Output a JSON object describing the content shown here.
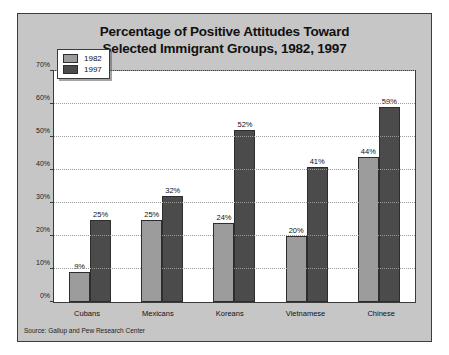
{
  "chart_data": {
    "type": "bar",
    "title": "Percentage of Positive Attitudes Toward Selected Immigrant Groups, 1982, 1997",
    "title_line1": "Percentage of Positive Attitudes Toward",
    "title_line2": "Selected Immigrant Groups, 1982, 1997",
    "xlabel": "",
    "ylabel": "",
    "ylim": [
      0,
      70
    ],
    "yticks": [
      0,
      10,
      20,
      30,
      40,
      50,
      60,
      70
    ],
    "ytick_labels": [
      "0%",
      "10%",
      "20%",
      "30%",
      "40%",
      "50%",
      "60%",
      "70%"
    ],
    "categories": [
      "Cubans",
      "Mexicans",
      "Koreans",
      "Vietnamese",
      "Chinese"
    ],
    "series": [
      {
        "name": "1982",
        "color": "#9c9c9c",
        "values": [
          9,
          25,
          24,
          20,
          44
        ],
        "labels": [
          "9%",
          "25%",
          "24%",
          "20%",
          "44%"
        ]
      },
      {
        "name": "1997",
        "color": "#4b4b4b",
        "values": [
          25,
          32,
          52,
          41,
          59
        ],
        "labels": [
          "25%",
          "32%",
          "52%",
          "41%",
          "59%"
        ]
      }
    ],
    "grid": true,
    "grid_style": "dotted-horizontal",
    "legend_position": "top-left",
    "source": "Source: Gallup and Pew Research Center"
  },
  "figure": {
    "panel_color": "#c6c6c6",
    "plot_background": "#ffffff",
    "border_color": "#3b3b3b"
  }
}
